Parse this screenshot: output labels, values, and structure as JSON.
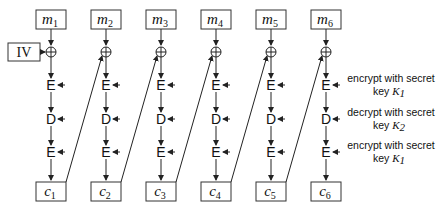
{
  "diagram": {
    "iv_label": "IV",
    "plaintext_blocks": [
      {
        "var": "m",
        "sub": "1"
      },
      {
        "var": "m",
        "sub": "2"
      },
      {
        "var": "m",
        "sub": "3"
      },
      {
        "var": "m",
        "sub": "4"
      },
      {
        "var": "m",
        "sub": "5"
      },
      {
        "var": "m",
        "sub": "6"
      }
    ],
    "ciphertext_blocks": [
      {
        "var": "c",
        "sub": "1"
      },
      {
        "var": "c",
        "sub": "2"
      },
      {
        "var": "c",
        "sub": "3"
      },
      {
        "var": "c",
        "sub": "4"
      },
      {
        "var": "c",
        "sub": "5"
      },
      {
        "var": "c",
        "sub": "6"
      }
    ],
    "xor_symbol": "⊕",
    "stages": [
      {
        "op": "E",
        "note_line1": "encrypt with secret",
        "note_key_prefix": "key ",
        "note_key": "K",
        "note_key_sub": "1"
      },
      {
        "op": "D",
        "note_line1": "decrypt with secret",
        "note_key_prefix": "key ",
        "note_key": "K",
        "note_key_sub": "2"
      },
      {
        "op": "E",
        "note_line1": "encrypt with secret",
        "note_key_prefix": "key ",
        "note_key": "K",
        "note_key_sub": "1"
      }
    ]
  }
}
